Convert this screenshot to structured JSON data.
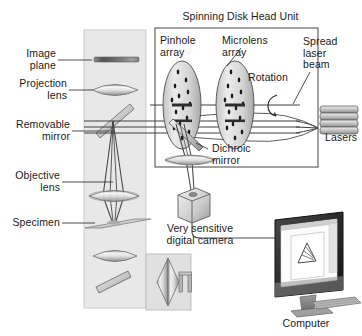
{
  "figure": {
    "title": "Spinning Disk Head Unit",
    "type": "optical-schematic"
  },
  "labels": {
    "head_unit": "Spinning Disk Head Unit",
    "image_plane": "Image\nplane",
    "projection_lens": "Projection\nlens",
    "removable_mirror": "Removable\nmirror",
    "objective_lens": "Objective\nlens",
    "specimen": "Specimen",
    "pinhole_array": "Pinhole\narray",
    "microlens_array": "Microlens\narray",
    "rotation": "Rotation",
    "spread_laser_beam": "Spread\nlaser\nbeam",
    "lasers": "Lasers",
    "dichroic_mirror": "Dichroic\nmirror",
    "camera": "Very sensitive\ndigital camera",
    "computer": "Computer"
  },
  "colors": {
    "background": "#ffffff",
    "column_panel": "#e6e6e6",
    "head_unit_fill": "#ffffff",
    "head_unit_border": "#4d4d4d",
    "stroke": "#3a3a3a",
    "text": "#1a1a1a",
    "lens_light": "#f2f2f2",
    "lens_mid": "#c9c9c9",
    "lens_dark": "#8a8a8a",
    "disk_fill": "#d9d9d9",
    "pinhole_dot": "#1a1a1a",
    "monitor_bezel": "#2b2b2b",
    "monitor_screen": "#fbfbfb",
    "monitor_stand": "#808080",
    "laser_body": "#bdbdbd",
    "camera_body": "#d2d2d2",
    "specimen_slide": "#cfcfcf"
  },
  "components": {
    "lasers_count": 4,
    "disks": [
      {
        "name": "pinhole-array-disk",
        "cx": 182,
        "cy": 105,
        "rx": 19,
        "ry": 44
      },
      {
        "name": "microlens-array-disk",
        "cx": 235,
        "cy": 105,
        "rx": 19,
        "ry": 44
      }
    ],
    "legend_panel_items": [
      "horizontal-lens",
      "diagonal-mirror",
      "vertical-lens",
      "specimen-holder"
    ]
  }
}
